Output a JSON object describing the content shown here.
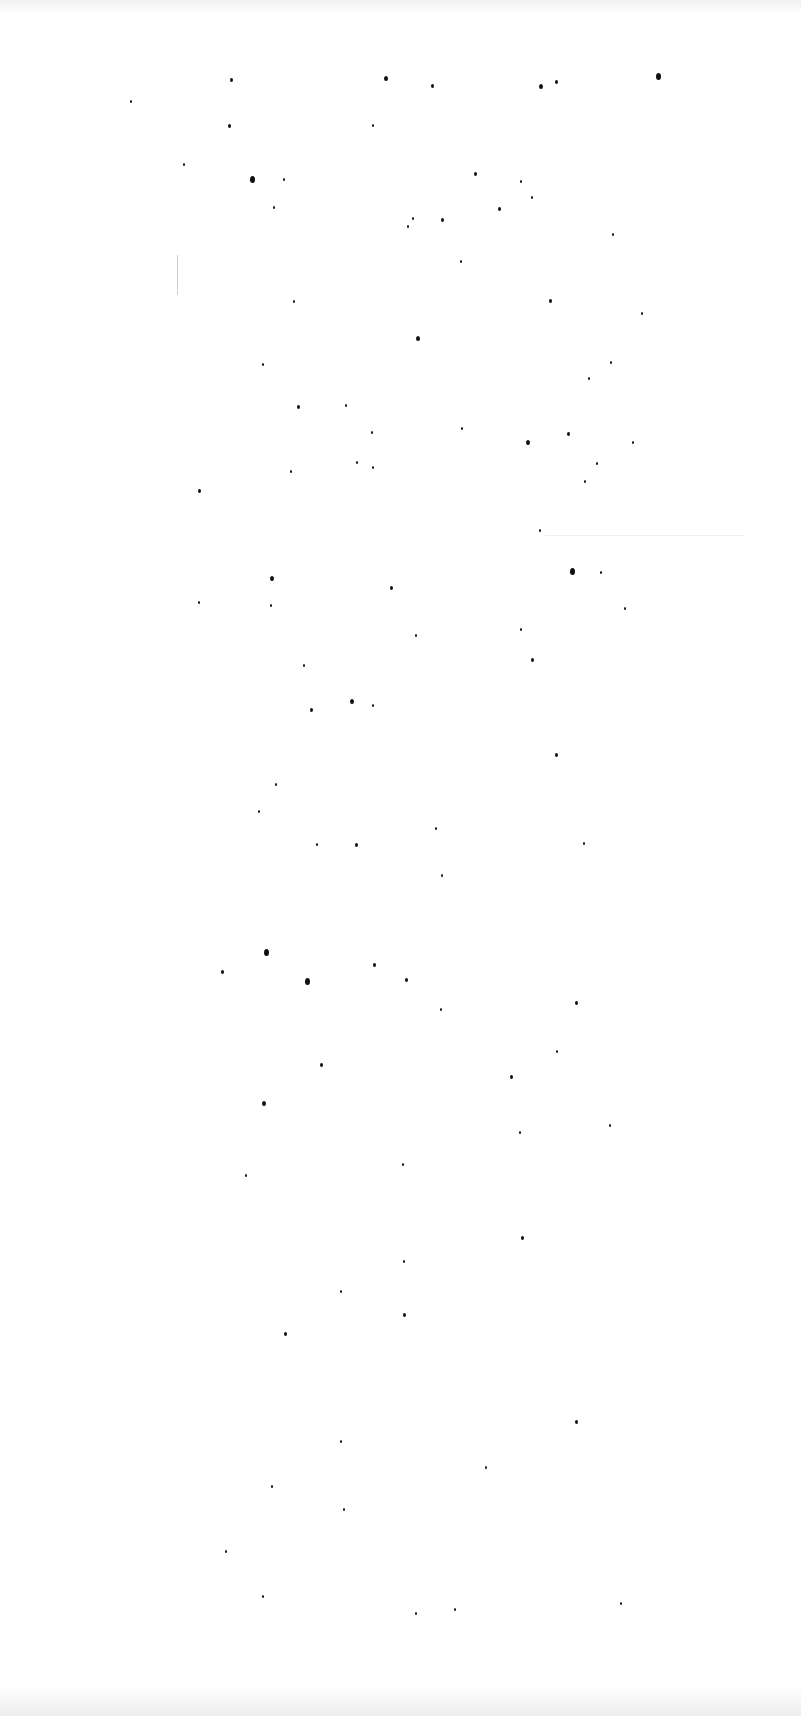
{
  "page": {
    "background": "#ffffff",
    "text_content": "",
    "speck_color": "#111111"
  },
  "specks": [
    [
      230,
      78,
      3
    ],
    [
      384,
      76,
      4
    ],
    [
      431,
      84,
      3
    ],
    [
      539,
      84,
      4
    ],
    [
      555,
      80,
      3
    ],
    [
      656,
      73,
      5
    ],
    [
      130,
      100,
      2
    ],
    [
      228,
      124,
      3
    ],
    [
      372,
      124,
      2
    ],
    [
      183,
      163,
      2
    ],
    [
      250,
      176,
      5
    ],
    [
      283,
      178,
      2
    ],
    [
      474,
      172,
      3
    ],
    [
      520,
      180,
      2
    ],
    [
      441,
      218,
      3
    ],
    [
      412,
      217,
      2
    ],
    [
      531,
      196,
      2
    ],
    [
      273,
      206,
      2
    ],
    [
      498,
      207,
      3
    ],
    [
      612,
      233,
      2
    ],
    [
      407,
      225,
      2
    ],
    [
      460,
      260,
      2
    ],
    [
      293,
      300,
      2
    ],
    [
      549,
      299,
      3
    ],
    [
      641,
      312,
      2
    ],
    [
      416,
      336,
      4
    ],
    [
      262,
      363,
      2
    ],
    [
      610,
      361,
      2
    ],
    [
      588,
      377,
      2
    ],
    [
      345,
      404,
      2
    ],
    [
      297,
      405,
      3
    ],
    [
      371,
      431,
      2
    ],
    [
      461,
      427,
      2
    ],
    [
      526,
      440,
      4
    ],
    [
      567,
      432,
      3
    ],
    [
      632,
      441,
      2
    ],
    [
      356,
      461,
      2
    ],
    [
      372,
      466,
      2
    ],
    [
      290,
      470,
      2
    ],
    [
      198,
      489,
      3
    ],
    [
      596,
      462,
      2
    ],
    [
      584,
      480,
      2
    ],
    [
      539,
      529,
      2
    ],
    [
      570,
      568,
      5
    ],
    [
      600,
      571,
      2
    ],
    [
      270,
      576,
      4
    ],
    [
      390,
      586,
      3
    ],
    [
      198,
      601,
      2
    ],
    [
      270,
      604,
      2
    ],
    [
      624,
      607,
      2
    ],
    [
      415,
      634,
      2
    ],
    [
      520,
      628,
      2
    ],
    [
      303,
      664,
      2
    ],
    [
      531,
      658,
      3
    ],
    [
      350,
      699,
      4
    ],
    [
      310,
      708,
      3
    ],
    [
      372,
      704,
      2
    ],
    [
      555,
      753,
      3
    ],
    [
      275,
      783,
      2
    ],
    [
      258,
      810,
      2
    ],
    [
      316,
      843,
      2
    ],
    [
      355,
      843,
      3
    ],
    [
      435,
      827,
      2
    ],
    [
      583,
      842,
      2
    ],
    [
      441,
      874,
      2
    ],
    [
      264,
      949,
      5
    ],
    [
      221,
      970,
      3
    ],
    [
      305,
      978,
      5
    ],
    [
      373,
      963,
      3
    ],
    [
      405,
      978,
      3
    ],
    [
      575,
      1001,
      3
    ],
    [
      440,
      1008,
      2
    ],
    [
      556,
      1050,
      2
    ],
    [
      320,
      1063,
      3
    ],
    [
      510,
      1075,
      3
    ],
    [
      262,
      1101,
      4
    ],
    [
      519,
      1131,
      2
    ],
    [
      609,
      1124,
      2
    ],
    [
      245,
      1174,
      2
    ],
    [
      402,
      1163,
      2
    ],
    [
      521,
      1236,
      3
    ],
    [
      403,
      1260,
      2
    ],
    [
      340,
      1290,
      2
    ],
    [
      403,
      1313,
      3
    ],
    [
      284,
      1332,
      3
    ],
    [
      575,
      1420,
      3
    ],
    [
      340,
      1440,
      2
    ],
    [
      485,
      1466,
      2
    ],
    [
      271,
      1485,
      2
    ],
    [
      343,
      1508,
      2
    ],
    [
      225,
      1550,
      2
    ],
    [
      262,
      1595,
      2
    ],
    [
      415,
      1612,
      2
    ],
    [
      454,
      1608,
      2
    ],
    [
      620,
      1602,
      2
    ]
  ]
}
